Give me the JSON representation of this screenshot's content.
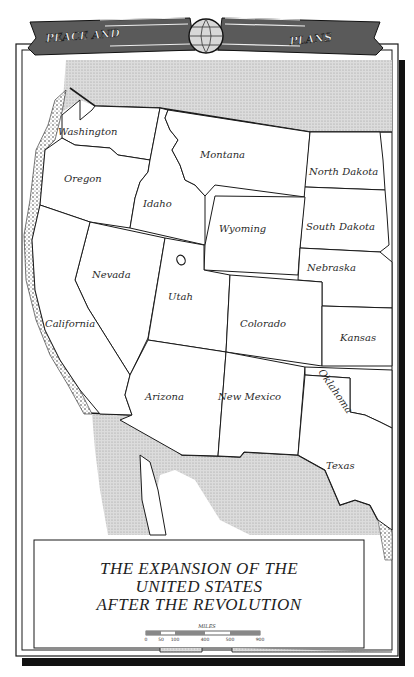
{
  "banner": {
    "left_text": "PEACE AND",
    "right_text": "PLANS",
    "emblem": "globe-icon"
  },
  "title": {
    "lines": [
      "THE EXPANSION OF THE",
      "UNITED STATES",
      "AFTER THE REVOLUTION"
    ]
  },
  "scale_bar": {
    "unit_label": "MILES",
    "ticks": [
      "0",
      "50",
      "100",
      "400",
      "500",
      "900"
    ]
  },
  "colors": {
    "ink": "#1a1a1a",
    "paper": "#ffffff",
    "hatched_region": "#d4d4d4",
    "frame_shadow": "#111111"
  },
  "map": {
    "states": [
      {
        "name": "Washington",
        "label_x": 58,
        "label_y": 135,
        "rotate": 0,
        "points": "62,115 80,100 80,120 92,110 95,106 160,108 150,160 118,155 110,148 75,145 62,138"
      },
      {
        "name": "Oregon",
        "label_x": 64,
        "label_y": 182,
        "rotate": 0,
        "points": "45,150 62,138 75,145 110,148 118,155 150,160 148,172 140,182 135,198 130,228 90,222 40,205"
      },
      {
        "name": "Idaho",
        "label_x": 143,
        "label_y": 207,
        "rotate": 0,
        "points": "160,108 168,110 165,118 170,130 178,140 172,150 180,165 185,180 195,185 205,196 205,245 130,228 135,198 140,182 148,172 150,160"
      },
      {
        "name": "Montana",
        "label_x": 200,
        "label_y": 158,
        "rotate": 0,
        "points": "168,110 310,132 305,197 215,185 205,196 195,185 185,180 180,165 172,150 178,140 170,130 165,118"
      },
      {
        "name": "North Dakota",
        "label_x": 309,
        "label_y": 175,
        "rotate": 0,
        "points": "310,132 380,132 383,160 385,190 305,187"
      },
      {
        "name": "South Dakota",
        "label_x": 306,
        "label_y": 230,
        "rotate": 0,
        "points": "305,187 385,190 387,215 389,245 380,252 300,248"
      },
      {
        "name": "Wyoming",
        "label_x": 219,
        "label_y": 232,
        "rotate": 0,
        "points": "215,196 305,197 300,248 298,275 204,270 205,245"
      },
      {
        "name": "Nebraska",
        "label_x": 307,
        "label_y": 271,
        "rotate": 0,
        "points": "300,248 380,252 392,262 392,308 322,306 322,282 298,280"
      },
      {
        "name": "Nevada",
        "label_x": 92,
        "label_y": 278,
        "rotate": 0,
        "points": "90,222 165,238 148,338 130,375 88,308 75,280"
      },
      {
        "name": "Utah",
        "label_x": 168,
        "label_y": 300,
        "rotate": 0,
        "points": "165,238 204,245 204,270 230,275 226,352 148,340"
      },
      {
        "name": "Colorado",
        "label_x": 240,
        "label_y": 327,
        "rotate": 0,
        "points": "230,275 322,282 322,366 226,352"
      },
      {
        "name": "Kansas",
        "label_x": 340,
        "label_y": 341,
        "rotate": 0,
        "points": "322,306 392,308 392,366 322,366"
      },
      {
        "name": "California",
        "label_x": 45,
        "label_y": 327,
        "rotate": 0,
        "points": "40,205 90,222 75,280 88,308 130,375 125,395 132,415 100,414 80,390 60,360 45,330 35,290 32,240"
      },
      {
        "name": "Arizona",
        "label_x": 145,
        "label_y": 400,
        "rotate": 0,
        "points": "148,340 226,352 218,456 182,455 120,420 132,415 125,395 130,375"
      },
      {
        "name": "New Mexico",
        "label_x": 218,
        "label_y": 400,
        "rotate": 0,
        "points": "226,352 305,367 298,455 244,452 240,457 218,456"
      },
      {
        "name": "Oklahoma",
        "label_x": 318,
        "label_y": 372,
        "rotate": 55,
        "points": "305,367 392,370 392,428 380,422 365,415 350,412 350,378 305,375"
      },
      {
        "name": "Texas",
        "label_x": 326,
        "label_y": 469,
        "rotate": 0,
        "points": "305,375 350,378 350,412 365,415 380,422 392,428 392,530 378,520 370,505 355,500 340,505 325,470 298,455"
      }
    ],
    "salt_lake": {
      "name": "Great Salt Lake",
      "cx": 181,
      "cy": 260
    }
  }
}
